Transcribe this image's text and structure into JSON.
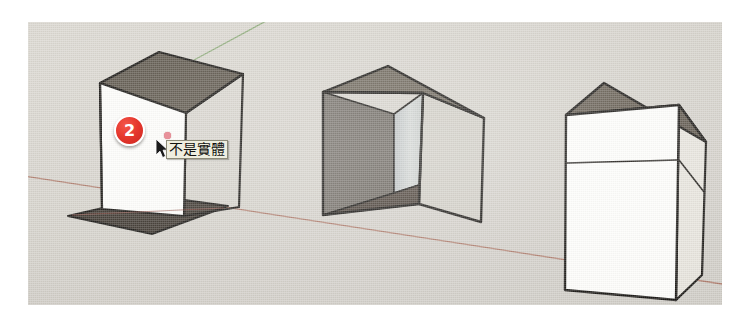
{
  "scene": {
    "title": "SketchUp modelling viewport",
    "background_color": "#d6d3cc",
    "page_background": "#ffffff",
    "axes": [
      {
        "name": "green-axis",
        "color": "#7fa36a"
      },
      {
        "name": "red-axis",
        "color": "#a4675b"
      }
    ]
  },
  "annotation": {
    "badge_number": "2",
    "badge_color": "#e5372d",
    "badge_text_color": "#ffffff",
    "tooltip_text": "不是實體",
    "tooltip_background": "#efeee0",
    "tooltip_border": "#8c8a78",
    "tooltip_text_color": "#121210",
    "cursor": "arrow-cursor",
    "inference_point_color": "#e8919a"
  },
  "objects": [
    {
      "name": "box-open-front-left",
      "label": "不是實體",
      "description": "open box, single white face with no volume",
      "faces": {
        "top": "#5a5348",
        "front": "#fdfdfb",
        "floor": "#3a332c",
        "right": "transparent"
      }
    },
    {
      "name": "box-open-front",
      "description": "open-fronted box showing interior walls",
      "faces": {
        "top": "#6a6357",
        "right": "#cfccc4",
        "interior_left": "#6e6962",
        "interior_back": "#c9cdcb",
        "interior_floor": "#4a4038"
      }
    },
    {
      "name": "box-solid",
      "description": "solid white box with horizontal lid seam",
      "faces": {
        "top": "#5e574c",
        "front": "#fdfdfb",
        "right": "#e6e3dc"
      }
    }
  ],
  "edge_color": "#14120f"
}
